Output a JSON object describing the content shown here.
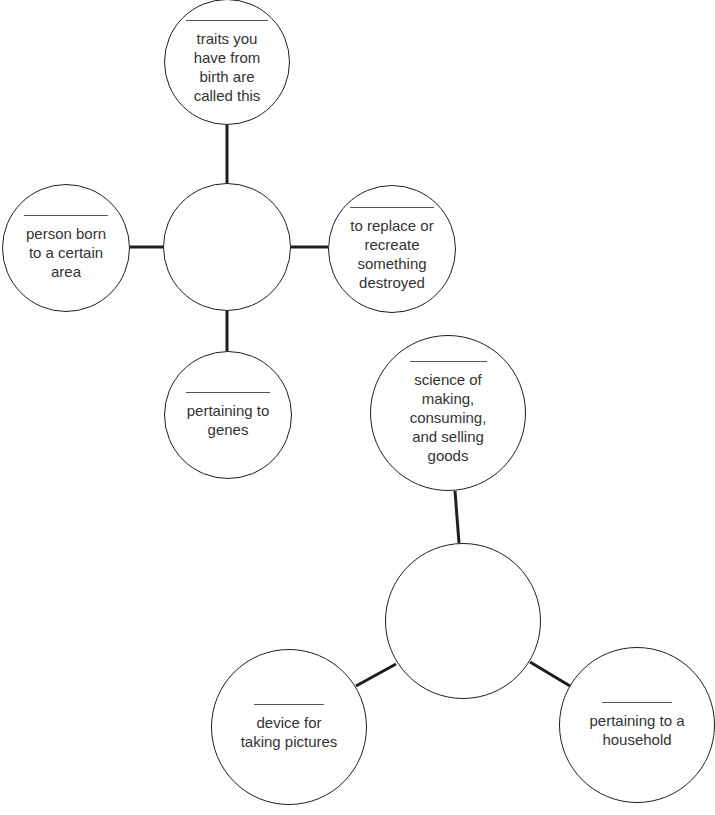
{
  "diagram": {
    "web1": {
      "center": {
        "label": "",
        "x": 227,
        "y": 247,
        "r": 64
      },
      "nodes": [
        {
          "id": "top",
          "x": 227,
          "y": 62,
          "r": 63,
          "blank": "",
          "clue": "traits you have from birth are called this",
          "lines": [
            "traits you",
            "have from",
            "birth are",
            "called this"
          ]
        },
        {
          "id": "left",
          "x": 66,
          "y": 248,
          "r": 64,
          "blank": "",
          "clue": "person born to a certain area",
          "lines": [
            "person born",
            "to a certain",
            "area"
          ]
        },
        {
          "id": "right",
          "x": 392,
          "y": 249,
          "r": 64,
          "blank": "",
          "clue": "to replace or recreate something destroyed",
          "lines": [
            "to replace or",
            "recreate",
            "something",
            "destroyed"
          ]
        },
        {
          "id": "bottom",
          "x": 227,
          "y": 415,
          "r": 64,
          "blank": "",
          "clue": "pertaining to genes",
          "lines": [
            "pertaining to",
            "genes"
          ]
        }
      ]
    },
    "web2": {
      "center": {
        "label": "",
        "x": 463,
        "y": 621,
        "r": 78
      },
      "nodes": [
        {
          "id": "top",
          "x": 448,
          "y": 413,
          "r": 78,
          "blank": "",
          "clue": "science of making, consuming, and selling goods",
          "lines": [
            "science of",
            "making,",
            "consuming,",
            "and selling",
            "goods"
          ]
        },
        {
          "id": "left",
          "x": 289,
          "y": 727,
          "r": 78,
          "blank": "",
          "clue": "device for taking pictures",
          "lines": [
            "device for",
            "taking pictures"
          ]
        },
        {
          "id": "right",
          "x": 637,
          "y": 725,
          "r": 78,
          "blank": "",
          "clue": "pertaining to a household",
          "lines": [
            "pertaining to a",
            "household"
          ]
        }
      ]
    },
    "colors": {
      "stroke": "#1e1e1e",
      "text": "#333333",
      "blank_line": "#555555",
      "background": "#ffffff"
    }
  }
}
